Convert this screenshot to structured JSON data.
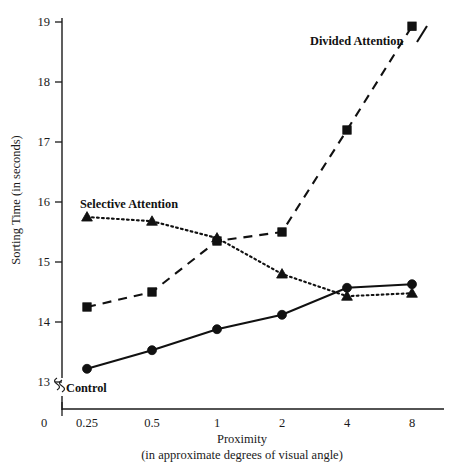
{
  "chart_data": {
    "type": "line",
    "title": "",
    "xlabel": "Proximity",
    "xlabel_sub": "(in approximate degrees of visual angle)",
    "ylabel": "Sorting Time (in seconds)",
    "categories": [
      "0.25",
      "0.5",
      "1",
      "2",
      "4",
      "8"
    ],
    "x_origin_label": "0",
    "ytick_labels": [
      "13",
      "14",
      "15",
      "16",
      "17",
      "18",
      "19"
    ],
    "ylim": [
      13,
      19
    ],
    "y_axis_break": true,
    "grid": false,
    "legend_position": "inline-annotations",
    "series": [
      {
        "name": "Divided Attention",
        "marker": "square",
        "line_style": "dashed",
        "color": "#111111",
        "values": [
          14.25,
          14.5,
          15.35,
          15.5,
          17.2,
          18.93
        ]
      },
      {
        "name": "Selective Attention",
        "marker": "triangle",
        "line_style": "dotted",
        "color": "#111111",
        "values": [
          15.75,
          15.68,
          15.4,
          14.8,
          14.43,
          14.48
        ]
      },
      {
        "name": "Control",
        "marker": "circle",
        "line_style": "solid",
        "color": "#111111",
        "values": [
          13.22,
          13.53,
          13.88,
          14.12,
          14.57,
          14.63
        ]
      }
    ],
    "annotations": [
      {
        "text": "Divided Attention",
        "x": 310,
        "y": 45
      },
      {
        "text": "Selective Attention",
        "x": 80,
        "y": 208
      },
      {
        "text": "Control",
        "x": 66,
        "y": 392
      }
    ]
  }
}
